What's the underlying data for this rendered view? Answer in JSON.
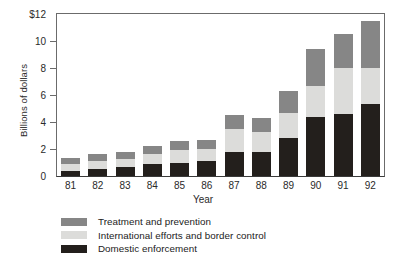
{
  "chart_data": {
    "type": "bar",
    "stacked": true,
    "title": "",
    "xlabel": "Year",
    "ylabel": "Billions of dollars",
    "categories": [
      "81",
      "82",
      "83",
      "84",
      "85",
      "86",
      "87",
      "88",
      "89",
      "90",
      "91",
      "92"
    ],
    "ylim": [
      0,
      12
    ],
    "yticks": [
      0,
      2,
      4,
      6,
      8,
      10,
      12
    ],
    "ytick_labels": [
      "0",
      "2",
      "4",
      "6",
      "8",
      "10",
      "$12"
    ],
    "grid": false,
    "legend_position": "below-left",
    "series": [
      {
        "name": "Domestic enforcement",
        "color": "#231f1c",
        "values": [
          0.4,
          0.55,
          0.65,
          0.9,
          1.0,
          1.1,
          1.8,
          1.75,
          2.8,
          4.35,
          4.6,
          5.3
        ]
      },
      {
        "name": "International efforts and border control",
        "color": "#dcdcda",
        "values": [
          0.5,
          0.55,
          0.6,
          0.7,
          0.9,
          0.9,
          1.65,
          1.5,
          1.9,
          2.3,
          3.4,
          2.7
        ]
      },
      {
        "name": "Treatment and prevention",
        "color": "#868686",
        "values": [
          0.45,
          0.5,
          0.5,
          0.6,
          0.7,
          0.7,
          1.05,
          1.05,
          1.6,
          2.75,
          2.5,
          3.5
        ]
      }
    ],
    "totals": [
      1.35,
      1.6,
      1.75,
      2.2,
      2.6,
      2.7,
      4.5,
      4.3,
      6.3,
      9.4,
      10.5,
      11.5
    ]
  },
  "legend": {
    "items": [
      {
        "label": "Treatment and prevention",
        "color": "#868686"
      },
      {
        "label": "International efforts and border control",
        "color": "#dcdcda"
      },
      {
        "label": "Domestic enforcement",
        "color": "#231f1c"
      }
    ]
  },
  "colors": {
    "axis": "#6b6b6b",
    "baseline": "#3a3a3a",
    "text": "#2a2a2a",
    "background": "#ffffff"
  }
}
